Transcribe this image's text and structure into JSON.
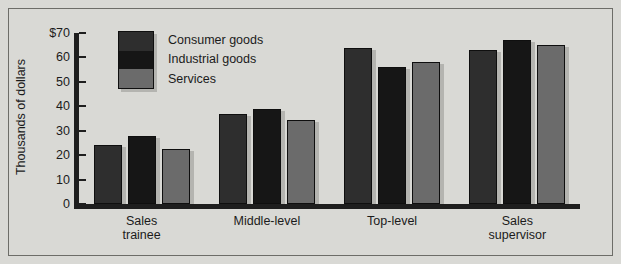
{
  "chart_data": {
    "type": "bar",
    "title": "",
    "xlabel": "",
    "ylabel": "Thousands of dollars",
    "ylim": [
      0,
      70
    ],
    "ytick_labels": [
      "$70",
      "60",
      "50",
      "40",
      "30",
      "20",
      "10",
      "0"
    ],
    "ytick_values": [
      70,
      60,
      50,
      40,
      30,
      20,
      10,
      0
    ],
    "grid": false,
    "legend_position": "top-left-inside",
    "categories": [
      "Sales\ntrainee",
      "Middle-level",
      "Top-level",
      "Sales\nsupervisor"
    ],
    "series": [
      {
        "name": "Consumer goods",
        "color": "#2e2e2e",
        "values": [
          24,
          37,
          64,
          63
        ]
      },
      {
        "name": "Industrial goods",
        "color": "#161616",
        "values": [
          28,
          39,
          56,
          67
        ]
      },
      {
        "name": "Services",
        "color": "#6b6b6b",
        "values": [
          22.5,
          34.5,
          58,
          65
        ]
      }
    ]
  },
  "legend": {
    "items": [
      {
        "label": "Consumer goods",
        "color": "#2e2e2e"
      },
      {
        "label": "Industrial goods",
        "color": "#161616"
      },
      {
        "label": "Services",
        "color": "#6b6b6b"
      }
    ]
  },
  "axes": {
    "y_title": "Thousands of dollars"
  },
  "colors": {
    "background": "#d9d9d5",
    "frame": "#6d6d68",
    "axis": "#1e1e1e",
    "shadow": "#b4b4b0",
    "text": "#1b1b1b"
  }
}
